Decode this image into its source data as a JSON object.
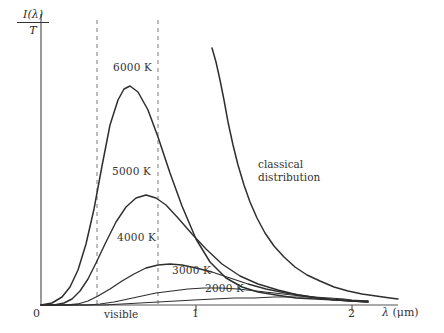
{
  "figure": {
    "background": "#ffffff",
    "ink_color": "#333333",
    "dash_color": "#8c8c8c"
  },
  "axes": {
    "y_label_numerator": "I(λ)",
    "y_label_denominator": "T",
    "x_label_symbol": "λ",
    "x_label_unit": "(μm)",
    "x_ticks": [
      {
        "value": "0",
        "x_px": 41
      },
      {
        "value": "1",
        "x_px": 196
      },
      {
        "value": "2",
        "x_px": 352
      }
    ],
    "x_range_um": [
      0,
      2.45
    ],
    "origin_px": {
      "x": 41,
      "y": 305
    },
    "top_px": 14,
    "right_px": 398
  },
  "visible_band": {
    "label": "visible",
    "left_px": 97,
    "right_px": 158,
    "left_um": 0.36,
    "right_um": 0.75,
    "line_style": "dashed"
  },
  "chart_data": {
    "type": "line",
    "title": "",
    "xlabel": "λ (μm)",
    "ylabel": "I(λ)/T",
    "xlim": [
      0,
      2.45
    ],
    "ylim": [
      0,
      1.0
    ],
    "grid": false,
    "legend": "inline-annotations",
    "x_tick_labels": [
      "0",
      "1",
      "2"
    ],
    "x_tick_values": [
      0,
      1,
      2
    ],
    "annotations": [
      {
        "text": "6000 K",
        "x_px": 113,
        "y_px": 68
      },
      {
        "text": "5000 K",
        "x_px": 112,
        "y_px": 172
      },
      {
        "text": "4000 K",
        "x_px": 117,
        "y_px": 238
      },
      {
        "text": "3000 K",
        "x_px": 172,
        "y_px": 270
      },
      {
        "text": "2000 K",
        "x_px": 205,
        "y_px": 288
      },
      {
        "text": "classical",
        "x_px": 258,
        "y_px": 165
      },
      {
        "text": "distribution",
        "x_px": 258,
        "y_px": 178
      },
      {
        "text": "visible",
        "x_px": 104,
        "y_px": 309
      }
    ],
    "series": [
      {
        "name": "6000 K",
        "temperature_K": 6000,
        "label": "6000 K",
        "peak": {
          "lambda_um": 0.53,
          "intensity": 0.755
        },
        "points_px": "41,305 52,303 62,297 70,287 78,270 86,244 94,209 102,166 110,125 118,100 124,89 130,86 138,92 148,110 158,137 170,173 182,206 196,239 210,262 226,278 242,287 258,292 276,295 296,298 316,299 336,300 352,301 368,301"
      },
      {
        "name": "5000 K",
        "temperature_K": 5000,
        "label": "5000 K",
        "peak": {
          "lambda_um": 0.66,
          "intensity": 0.52
        },
        "points_px": "41,305 54,305 64,303 72,299 80,291 88,279 96,263 106,242 116,222 126,207 136,198 146,195 156,198 166,205 178,218 192,234 206,249 222,264 240,276 258,284 278,290 298,295 318,298 336,300 352,301 368,302"
      },
      {
        "name": "4000 K",
        "temperature_K": 4000,
        "label": "4000 K",
        "peak": {
          "lambda_um": 0.83,
          "intensity": 0.26
        },
        "points_px": "41,305 56,305 68,305 78,304 88,301 98,296 110,289 122,281 134,274 146,268 158,265 170,264 182,265 196,268 212,272 230,278 248,284 266,289 286,293 306,296 324,299 340,300 352,301 368,302"
      },
      {
        "name": "3000 K",
        "temperature_K": 3000,
        "label": "3000 K",
        "peak": {
          "lambda_um": 1.1,
          "intensity": 0.115
        },
        "points_px": "41,305 60,305 74,305 88,305 100,304 114,302 128,299 142,296 156,293 172,291 188,289 204,288 220,288 238,289 256,291 274,293 292,295 310,297 328,299 344,300 352,301 368,302"
      },
      {
        "name": "2000 K",
        "temperature_K": 2000,
        "label": "2000 K",
        "peak": {
          "lambda_um": 1.6,
          "intensity": 0.05
        },
        "points_px": "41,305 64,305 84,305 104,305 122,304 140,303 158,302 176,301 194,300 214,299 234,298 254,298 274,297 294,297 314,297 330,298 344,299 352,300 368,301"
      },
      {
        "name": "classical distribution",
        "label": "classical distribution",
        "is_classical": true,
        "points_px": "212,48 216,62 220,80 224,100 228,122 233,145 238,165 244,185 250,202 257,218 265,233 274,246 284,257 295,267 307,275 320,281 334,287 348,291 362,294 376,296 390,298 398,299"
      }
    ]
  }
}
